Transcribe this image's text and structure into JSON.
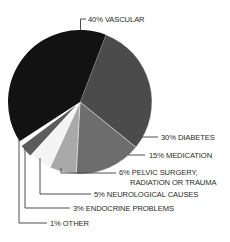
{
  "chart_data": {
    "type": "pie",
    "title": "",
    "categories": [
      "Vascular",
      "Diabetes",
      "Medication",
      "Pelvic surgery, radiation or trauma",
      "Neurological causes",
      "Endocrine problems",
      "Other"
    ],
    "values": [
      40,
      30,
      15,
      6,
      5,
      3,
      1
    ],
    "unit": "%",
    "start_angle_deg_clockwise_from_top": 21,
    "slices": [
      {
        "key": "diabetes",
        "label": "30% DIABETES",
        "value": 30,
        "color": "#4b4b4b"
      },
      {
        "key": "medication",
        "label": "15% MEDICATION",
        "value": 15,
        "color": "#6d6d6d"
      },
      {
        "key": "pelvic",
        "label_line1": "6% PELVIC SURGERY,",
        "label_line2": "RADIATION OR TRAUMA",
        "value": 6,
        "color": "#a9a9a9"
      },
      {
        "key": "neurological",
        "label": "5% NEUROLOGICAL CAUSES",
        "value": 5,
        "color": "#f4f4f4"
      },
      {
        "key": "endocrine",
        "label": "3%  ENDOCRINE PROBLEMS",
        "value": 3,
        "color": "#5c5c5c",
        "exploded": true
      },
      {
        "key": "other",
        "label": "1% OTHER",
        "value": 1,
        "color": "#ffffff"
      },
      {
        "key": "vascular",
        "label": "40% VASCULAR",
        "value": 40,
        "color": "#121212"
      }
    ],
    "legend": "leader-line labels"
  },
  "labels": {
    "vascular": "40% VASCULAR",
    "diabetes": "30% DIABETES",
    "medication": "15% MEDICATION",
    "pelvic_1": "6% PELVIC SURGERY,",
    "pelvic_2": "RADIATION OR TRAUMA",
    "neurological": "5% NEUROLOGICAL CAUSES",
    "endocrine": "3%  ENDOCRINE PROBLEMS",
    "other": "1% OTHER"
  }
}
